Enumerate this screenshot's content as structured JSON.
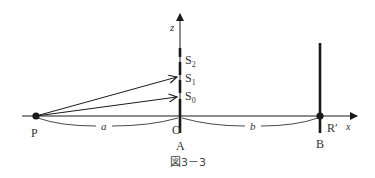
{
  "figure": {
    "caption": "図3－3",
    "colors": {
      "ink": "#1a1a1a",
      "label": "#333333",
      "background": "#ffffff"
    }
  },
  "axes": {
    "x_label": "x",
    "z_label": "z"
  },
  "points": {
    "source": "P",
    "origin": "O",
    "screen_point": "R′"
  },
  "barriers": {
    "slit_plate": "A",
    "screen": "B"
  },
  "slits": [
    {
      "label": "S",
      "sub": "2"
    },
    {
      "label": "S",
      "sub": "1"
    },
    {
      "label": "S",
      "sub": "0"
    }
  ],
  "distances": {
    "source_to_slit": "a",
    "slit_to_screen": "b"
  }
}
